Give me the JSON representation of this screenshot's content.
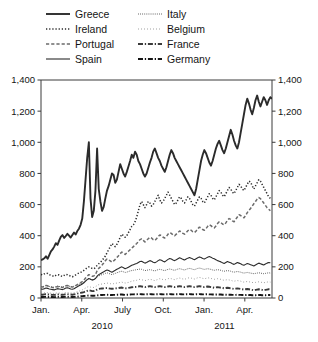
{
  "chart_data": {
    "type": "line",
    "title": "",
    "subtitle": "",
    "xlabel": "",
    "ylabel": "",
    "ylim": [
      0,
      1400
    ],
    "yticks": [
      0,
      200,
      400,
      600,
      800,
      1000,
      1200,
      1400
    ],
    "ytick_labels": [
      "0",
      "200",
      "400",
      "600",
      "800",
      "1,000",
      "1,200",
      "1,400"
    ],
    "y_axis_right_mirrored": true,
    "grid": false,
    "legend_position": "top",
    "legend_columns": 2,
    "xtick_labels": [
      "Jan.",
      "Apr.",
      "July",
      "Oct.",
      "Jan.",
      "Apr."
    ],
    "xtick_positions": [
      0,
      3,
      6,
      9,
      12,
      15
    ],
    "year_labels": [
      {
        "label": "2010",
        "position": 4.5
      },
      {
        "label": "2011",
        "position": 13.5
      }
    ],
    "x_unit": "months since Jan. 2010",
    "x_range": [
      0,
      17
    ],
    "series": [
      {
        "name": "Greece",
        "style": "solid",
        "width": 1.9,
        "color": "#2b2b2b",
        "values": [
          243,
          248,
          255,
          268,
          252,
          276,
          300,
          312,
          330,
          352,
          341,
          368,
          392,
          404,
          386,
          398,
          412,
          400,
          388,
          405,
          420,
          408,
          430,
          445,
          470,
          510,
          620,
          760,
          900,
          1000,
          640,
          520,
          560,
          690,
          960,
          700,
          620,
          560,
          585,
          640,
          690,
          720,
          760,
          800,
          790,
          740,
          760,
          810,
          860,
          830,
          800,
          780,
          810,
          845,
          880,
          920,
          900,
          940,
          920,
          880,
          860,
          830,
          800,
          780,
          800,
          835,
          870,
          900,
          940,
          960,
          930,
          900,
          880,
          850,
          830,
          810,
          840,
          880,
          920,
          950,
          930,
          900,
          880,
          860,
          840,
          820,
          800,
          780,
          760,
          740,
          720,
          700,
          680,
          660,
          700,
          760,
          820,
          880,
          920,
          950,
          930,
          900,
          870,
          850,
          880,
          920,
          960,
          990,
          1010,
          980,
          950,
          930,
          960,
          1000,
          1040,
          1080,
          1050,
          1010,
          980,
          960,
          1000,
          1060,
          1120,
          1180,
          1240,
          1280,
          1250,
          1210,
          1180,
          1220,
          1270,
          1300,
          1260,
          1230,
          1260,
          1290,
          1270,
          1240,
          1270,
          1290,
          1280
        ]
      },
      {
        "name": "Ireland",
        "style": "dotted-fine",
        "width": 1.5,
        "color": "#2b2b2b",
        "values": [
          152,
          148,
          155,
          160,
          158,
          150,
          146,
          142,
          138,
          145,
          150,
          148,
          142,
          138,
          145,
          152,
          150,
          145,
          140,
          136,
          142,
          148,
          155,
          160,
          165,
          170,
          178,
          186,
          195,
          200,
          196,
          190,
          188,
          195,
          210,
          220,
          230,
          240,
          255,
          270,
          290,
          310,
          330,
          350,
          340,
          330,
          345,
          365,
          390,
          410,
          400,
          390,
          400,
          420,
          440,
          460,
          470,
          490,
          520,
          560,
          600,
          620,
          600,
          580,
          600,
          620,
          610,
          590,
          600,
          620,
          640,
          660,
          630,
          610,
          620,
          640,
          660,
          680,
          660,
          640,
          620,
          600,
          610,
          630,
          650,
          640,
          620,
          610,
          630,
          650,
          640,
          620,
          600,
          590,
          610,
          630,
          650,
          640,
          620,
          610,
          630,
          650,
          670,
          660,
          640,
          630,
          650,
          670,
          690,
          680,
          660,
          650,
          670,
          690,
          710,
          700,
          680,
          670,
          690,
          710,
          730,
          720,
          700,
          690,
          710,
          730,
          750,
          745,
          720,
          700,
          720,
          740,
          760,
          750,
          730,
          710,
          690,
          670,
          650,
          640
        ]
      },
      {
        "name": "Portugal",
        "style": "dashed",
        "width": 1.5,
        "color": "#6b6b6b",
        "values": [
          72,
          70,
          75,
          80,
          78,
          74,
          70,
          68,
          66,
          70,
          74,
          72,
          70,
          68,
          72,
          78,
          80,
          76,
          72,
          70,
          74,
          80,
          86,
          92,
          98,
          105,
          115,
          128,
          140,
          150,
          145,
          140,
          142,
          150,
          175,
          190,
          200,
          212,
          225,
          240,
          250,
          245,
          238,
          230,
          238,
          248,
          260,
          272,
          285,
          295,
          288,
          280,
          290,
          300,
          310,
          320,
          330,
          340,
          350,
          362,
          375,
          380,
          370,
          360,
          370,
          380,
          390,
          385,
          375,
          370,
          380,
          395,
          405,
          400,
          390,
          385,
          395,
          410,
          420,
          415,
          405,
          400,
          410,
          420,
          430,
          425,
          415,
          410,
          420,
          432,
          440,
          435,
          425,
          420,
          430,
          445,
          455,
          450,
          440,
          435,
          445,
          460,
          470,
          465,
          455,
          450,
          462,
          478,
          490,
          485,
          475,
          470,
          482,
          498,
          510,
          505,
          495,
          490,
          505,
          520,
          535,
          530,
          520,
          515,
          530,
          548,
          562,
          575,
          590,
          605,
          620,
          635,
          645,
          638,
          625,
          610,
          595,
          580,
          570,
          560
        ]
      },
      {
        "name": "Spain",
        "style": "solid",
        "width": 1.1,
        "color": "#2b2b2b",
        "values": [
          58,
          56,
          60,
          64,
          62,
          58,
          56,
          54,
          52,
          56,
          60,
          58,
          56,
          54,
          58,
          64,
          66,
          62,
          58,
          56,
          60,
          66,
          72,
          78,
          84,
          90,
          98,
          108,
          118,
          125,
          120,
          115,
          118,
          125,
          140,
          150,
          156,
          162,
          168,
          175,
          180,
          176,
          170,
          166,
          172,
          178,
          185,
          190,
          196,
          200,
          194,
          188,
          192,
          198,
          204,
          210,
          214,
          218,
          222,
          228,
          234,
          236,
          230,
          224,
          228,
          234,
          240,
          236,
          230,
          226,
          232,
          240,
          246,
          242,
          236,
          232,
          240,
          248,
          254,
          250,
          244,
          240,
          246,
          252,
          258,
          254,
          248,
          244,
          250,
          256,
          260,
          256,
          250,
          246,
          252,
          258,
          264,
          260,
          254,
          250,
          256,
          262,
          266,
          262,
          256,
          252,
          246,
          240,
          236,
          232,
          226,
          222,
          228,
          234,
          230,
          226,
          220,
          216,
          222,
          228,
          224,
          220,
          214,
          210,
          216,
          222,
          218,
          214,
          210,
          206,
          212,
          218,
          224,
          220,
          216,
          212,
          218,
          224,
          228,
          226
        ]
      },
      {
        "name": "Italy",
        "style": "dotted-fine",
        "width": 1.0,
        "color": "#4a4a4a",
        "values": [
          74,
          72,
          76,
          80,
          78,
          74,
          72,
          70,
          68,
          72,
          76,
          74,
          72,
          70,
          74,
          78,
          80,
          76,
          74,
          72,
          76,
          80,
          84,
          88,
          92,
          96,
          102,
          110,
          118,
          124,
          120,
          116,
          118,
          124,
          134,
          142,
          146,
          150,
          154,
          158,
          162,
          158,
          154,
          150,
          154,
          158,
          162,
          166,
          170,
          172,
          168,
          164,
          166,
          170,
          174,
          176,
          178,
          180,
          182,
          184,
          186,
          184,
          180,
          176,
          178,
          180,
          182,
          180,
          176,
          174,
          178,
          182,
          184,
          182,
          178,
          176,
          180,
          184,
          186,
          184,
          180,
          178,
          182,
          186,
          188,
          186,
          182,
          180,
          184,
          188,
          190,
          188,
          184,
          182,
          186,
          190,
          192,
          190,
          186,
          184,
          186,
          188,
          186,
          184,
          180,
          178,
          180,
          182,
          180,
          178,
          174,
          172,
          174,
          176,
          174,
          172,
          168,
          166,
          168,
          170,
          168,
          166,
          162,
          160,
          162,
          164,
          162,
          160,
          158,
          156,
          158,
          160,
          162,
          160,
          158,
          156,
          158,
          160,
          162,
          160
        ]
      },
      {
        "name": "Belgium",
        "style": "dotted-sparse",
        "width": 1.0,
        "color": "#8a8a8a",
        "values": [
          32,
          31,
          33,
          35,
          34,
          32,
          31,
          30,
          29,
          31,
          33,
          32,
          31,
          30,
          32,
          34,
          35,
          33,
          32,
          31,
          33,
          36,
          40,
          44,
          48,
          52,
          58,
          64,
          70,
          74,
          70,
          66,
          68,
          72,
          80,
          86,
          88,
          90,
          92,
          94,
          96,
          94,
          92,
          90,
          92,
          94,
          96,
          98,
          100,
          102,
          98,
          96,
          98,
          100,
          104,
          108,
          110,
          112,
          114,
          118,
          120,
          118,
          114,
          112,
          114,
          118,
          120,
          118,
          114,
          112,
          116,
          120,
          124,
          122,
          118,
          116,
          120,
          124,
          126,
          124,
          120,
          118,
          122,
          126,
          128,
          126,
          122,
          120,
          124,
          128,
          130,
          128,
          124,
          122,
          126,
          130,
          132,
          130,
          126,
          124,
          126,
          130,
          128,
          126,
          122,
          120,
          122,
          124,
          122,
          120,
          116,
          114,
          116,
          118,
          116,
          114,
          110,
          108,
          110,
          112,
          110,
          108,
          104,
          102,
          104,
          106,
          104,
          102,
          100,
          98,
          100,
          102,
          104,
          102,
          100,
          98,
          100,
          102,
          104,
          102
        ]
      },
      {
        "name": "France",
        "style": "dashdot",
        "width": 1.9,
        "color": "#3a3a3a",
        "values": [
          22,
          21,
          23,
          24,
          23,
          22,
          21,
          20,
          20,
          21,
          23,
          22,
          21,
          20,
          22,
          24,
          25,
          23,
          22,
          21,
          23,
          25,
          28,
          30,
          33,
          35,
          38,
          42,
          46,
          50,
          47,
          44,
          45,
          48,
          54,
          58,
          60,
          61,
          62,
          63,
          64,
          62,
          60,
          59,
          60,
          62,
          63,
          64,
          66,
          67,
          64,
          62,
          63,
          65,
          67,
          69,
          70,
          71,
          72,
          74,
          76,
          74,
          72,
          70,
          72,
          74,
          76,
          74,
          72,
          70,
          72,
          74,
          76,
          74,
          72,
          70,
          72,
          74,
          76,
          74,
          72,
          70,
          72,
          74,
          76,
          74,
          72,
          70,
          72,
          74,
          76,
          74,
          72,
          70,
          72,
          74,
          76,
          74,
          72,
          70,
          72,
          74,
          72,
          70,
          68,
          66,
          68,
          70,
          68,
          66,
          64,
          62,
          64,
          66,
          64,
          62,
          60,
          58,
          60,
          62,
          60,
          58,
          56,
          54,
          56,
          58,
          56,
          54,
          52,
          50,
          52,
          54,
          56,
          54,
          52,
          50,
          52,
          54,
          56,
          54
        ]
      },
      {
        "name": "Germany",
        "style": "dashdot",
        "width": 1.9,
        "color": "#151515",
        "values": [
          6,
          6,
          7,
          7,
          7,
          6,
          6,
          6,
          5,
          6,
          7,
          7,
          6,
          6,
          7,
          7,
          8,
          7,
          7,
          6,
          7,
          8,
          9,
          10,
          11,
          12,
          13,
          14,
          15,
          16,
          15,
          14,
          14,
          15,
          17,
          18,
          19,
          19,
          20,
          20,
          21,
          20,
          19,
          19,
          20,
          20,
          21,
          21,
          22,
          22,
          21,
          20,
          21,
          21,
          22,
          23,
          23,
          24,
          24,
          25,
          25,
          24,
          23,
          23,
          24,
          24,
          25,
          24,
          23,
          23,
          24,
          24,
          25,
          24,
          23,
          23,
          24,
          24,
          25,
          24,
          23,
          23,
          24,
          24,
          25,
          24,
          23,
          23,
          24,
          24,
          25,
          24,
          23,
          23,
          24,
          24,
          25,
          24,
          23,
          23,
          24,
          24,
          23,
          23,
          22,
          22,
          22,
          23,
          22,
          22,
          21,
          21,
          21,
          22,
          21,
          21,
          20,
          20,
          20,
          21,
          20,
          20,
          19,
          19,
          19,
          20,
          19,
          19,
          18,
          18,
          18,
          19,
          19,
          19,
          18,
          18,
          18,
          19,
          19,
          19
        ]
      }
    ],
    "legend_entries": [
      {
        "label": "Greece",
        "style": "solid",
        "width": 1.9,
        "color": "#2b2b2b"
      },
      {
        "label": "Ireland",
        "style": "dotted-fine",
        "width": 1.5,
        "color": "#2b2b2b"
      },
      {
        "label": "Portugal",
        "style": "dashed",
        "width": 1.5,
        "color": "#6b6b6b"
      },
      {
        "label": "Spain",
        "style": "solid",
        "width": 1.1,
        "color": "#2b2b2b"
      },
      {
        "label": "Italy",
        "style": "dotted-fine",
        "width": 1.0,
        "color": "#4a4a4a"
      },
      {
        "label": "Belgium",
        "style": "dotted-sparse",
        "width": 1.0,
        "color": "#8a8a8a"
      },
      {
        "label": "France",
        "style": "dashdot",
        "width": 1.9,
        "color": "#3a3a3a"
      },
      {
        "label": "Germany",
        "style": "dashdot",
        "width": 1.9,
        "color": "#151515"
      }
    ]
  }
}
